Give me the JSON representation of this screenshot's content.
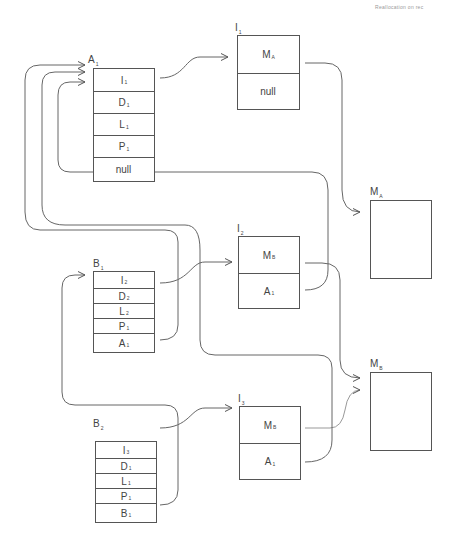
{
  "header": {
    "text": "Reallocation on rec"
  },
  "nodes": {
    "A1": {
      "label": "A",
      "sub": "1",
      "cells": [
        {
          "t": "I",
          "s": "1"
        },
        {
          "t": "D",
          "s": "1"
        },
        {
          "t": "L",
          "s": "1"
        },
        {
          "t": "P",
          "s": "1"
        },
        {
          "t": "null",
          "s": ""
        }
      ]
    },
    "B1": {
      "label": "B",
      "sub": "1",
      "cells": [
        {
          "t": "I",
          "s": "2"
        },
        {
          "t": "D",
          "s": "2"
        },
        {
          "t": "L",
          "s": "2"
        },
        {
          "t": "P",
          "s": "1"
        },
        {
          "t": "A",
          "s": "1"
        }
      ]
    },
    "B2": {
      "label": "B",
      "sub": "2",
      "cells": [
        {
          "t": "I",
          "s": "3"
        },
        {
          "t": "D",
          "s": "1"
        },
        {
          "t": "L",
          "s": "1"
        },
        {
          "t": "P",
          "s": "1"
        },
        {
          "t": "B",
          "s": "1"
        }
      ]
    },
    "I1": {
      "label": "I",
      "sub": "1",
      "cells": [
        {
          "t": "M",
          "s": "A"
        },
        {
          "t": "null",
          "s": ""
        }
      ]
    },
    "I2": {
      "label": "I",
      "sub": "2",
      "cells": [
        {
          "t": "M",
          "s": "B"
        },
        {
          "t": "A",
          "s": "1"
        }
      ]
    },
    "I3": {
      "label": "I",
      "sub": "3",
      "cells": [
        {
          "t": "M",
          "s": "B"
        },
        {
          "t": "A",
          "s": "1"
        }
      ]
    },
    "MA": {
      "label": "M",
      "sub": "A"
    },
    "MB": {
      "label": "M",
      "sub": "B"
    }
  },
  "colors": {
    "line": "#555555",
    "text": "#444444"
  }
}
